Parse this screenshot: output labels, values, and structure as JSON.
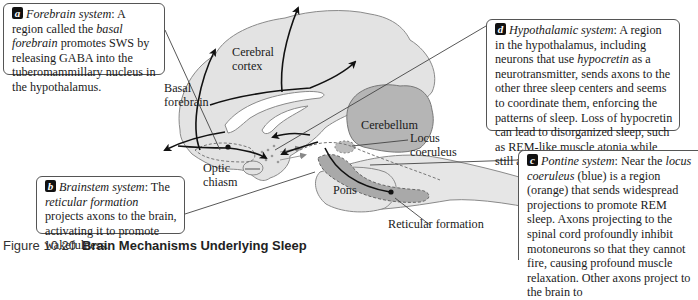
{
  "figure": {
    "caption_number": "Figure 10.20",
    "caption_title": "Brain Mechanisms Underlying Sleep"
  },
  "callouts": {
    "a": {
      "badge": "a",
      "term": "Forebrain system",
      "text_1": ": A region called the ",
      "italic_1": "basal forebrain",
      "text_2": " promotes SWS by releasing GABA into the tuberomammillary nucleus in the hypothalamus."
    },
    "b": {
      "badge": "b",
      "term": "Brainstem system",
      "text_1": ": The ",
      "italic_1": "reticular formation",
      "text_2": " projects axons to the brain, activating it to promote wakefulness."
    },
    "c": {
      "badge": "c",
      "term": "Pontine system",
      "text_1": ": Near the ",
      "italic_1": "locus coeruleus",
      "text_2": " (blue) is a region (orange) that sends widespread projections to promote REM sleep. Axons projecting to the spinal cord profoundly inhibit motoneurons so that they cannot fire, causing profound muscle relaxation. Other axons project to the brain to"
    },
    "d": {
      "badge": "d",
      "term": "Hypothalamic system",
      "text_1": ": A region in the hypothalamus, including neurons that use ",
      "italic_1": "hypocretin",
      "text_2": " as a neurotransmitter, sends axons to the other three sleep centers and seems to coordinate them, enforcing the patterns of sleep. Loss of hypocretin can lead to disorganized sleep, such as REM-like muscle atonia while still awake (in narcolepsy)."
    }
  },
  "labels": {
    "cerebral_cortex": [
      "Cerebral",
      "cortex"
    ],
    "basal_forebrain": [
      "Basal",
      "forebrain"
    ],
    "optic_chiasm": [
      "Optic",
      "chiasm"
    ],
    "cerebellum": "Cerebellum",
    "locus_coeruleus": [
      "Locus",
      "coeruleus"
    ],
    "pons": "Pons",
    "reticular_formation": "Reticular formation"
  },
  "colors": {
    "brain_fill": "#e3e3e3",
    "brain_outline": "#8a8a8a",
    "cerebellum_fill": "#b5b5b5",
    "reticular_fill": "#a9a9a9",
    "locus_fill": "#bdbdbd",
    "pathway": "#111111",
    "dashed": "#777777"
  }
}
